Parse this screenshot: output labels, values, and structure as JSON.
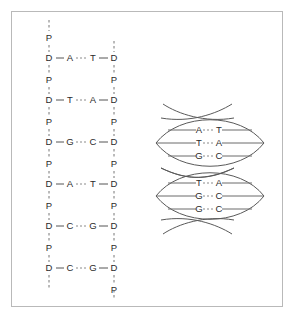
{
  "figure": {
    "background_color": "#ffffff",
    "frame_color": "#b9b9b9",
    "text_color": "#2b2b2b",
    "bond_color": "#555555",
    "hbond_color": "#8a8a8a",
    "helix_color": "#5a5a5a"
  },
  "ladder": {
    "left_backbone": [
      {
        "label": "P"
      },
      {
        "label": "D"
      },
      {
        "label": "P"
      },
      {
        "label": "D"
      },
      {
        "label": "P"
      },
      {
        "label": "D"
      },
      {
        "label": "P"
      },
      {
        "label": "D"
      },
      {
        "label": "P"
      },
      {
        "label": "D"
      },
      {
        "label": "P"
      },
      {
        "label": "D"
      }
    ],
    "right_backbone": [
      {
        "label": "D"
      },
      {
        "label": "P"
      },
      {
        "label": "D"
      },
      {
        "label": "P"
      },
      {
        "label": "D"
      },
      {
        "label": "P"
      },
      {
        "label": "D"
      },
      {
        "label": "P"
      },
      {
        "label": "D"
      },
      {
        "label": "P"
      },
      {
        "label": "D"
      },
      {
        "label": "P"
      }
    ],
    "base_pairs": [
      {
        "left_base": "A",
        "right_base": "T"
      },
      {
        "left_base": "T",
        "right_base": "A"
      },
      {
        "left_base": "G",
        "right_base": "C"
      },
      {
        "left_base": "A",
        "right_base": "T"
      },
      {
        "left_base": "C",
        "right_base": "G"
      },
      {
        "left_base": "C",
        "right_base": "G"
      }
    ]
  },
  "helix": {
    "turns": [
      {
        "rows": [
          {
            "left_base": "A",
            "right_base": "T"
          },
          {
            "left_base": "T",
            "right_base": "A"
          },
          {
            "left_base": "G",
            "right_base": "C"
          }
        ]
      },
      {
        "rows": [
          {
            "left_base": "T",
            "right_base": "A"
          },
          {
            "left_base": "G",
            "right_base": "C"
          },
          {
            "left_base": "G",
            "right_base": "C"
          }
        ]
      }
    ]
  }
}
